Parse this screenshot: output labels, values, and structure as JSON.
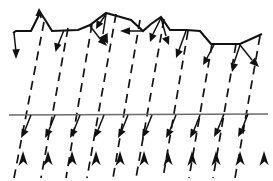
{
  "figure": {
    "width": 273,
    "height": 181,
    "background_color": "#ffffff"
  },
  "chart_data": {
    "type": "line",
    "title": "",
    "subtitle": "",
    "xlabel": "",
    "ylabel": "",
    "grid": false,
    "legend": "none",
    "xlim": [
      0,
      273
    ],
    "ylim": [
      181,
      0
    ],
    "series": [
      {
        "name": "terrain-surface-profile",
        "style": "solid-thick",
        "color": "#111111",
        "points": [
          [
            13,
            33
          ],
          [
            16,
            31
          ],
          [
            31,
            31
          ],
          [
            40,
            13
          ],
          [
            44,
            18
          ],
          [
            52,
            31
          ],
          [
            78,
            30
          ],
          [
            90,
            25
          ],
          [
            106,
            13
          ],
          [
            117,
            16
          ],
          [
            131,
            20
          ],
          [
            143,
            31
          ],
          [
            151,
            24
          ],
          [
            161,
            17
          ],
          [
            170,
            30
          ],
          [
            186,
            30
          ],
          [
            200,
            31
          ],
          [
            211,
            44
          ],
          [
            240,
            44
          ],
          [
            262,
            34
          ]
        ]
      },
      {
        "name": "reference-ground-line",
        "style": "solid-thin",
        "color": "#6b6b6b",
        "points": [
          [
            9,
            115
          ],
          [
            268,
            114
          ]
        ]
      }
    ],
    "rays": {
      "name": "incident-ray-family",
      "style": "dashed",
      "color": "#111111",
      "count": 10,
      "direction_deg": 100,
      "ground_crossings_x": [
        31,
        55,
        80,
        104,
        128,
        152,
        176,
        200,
        224,
        248
      ],
      "top_x": [
        44,
        68,
        92,
        116,
        140,
        164,
        188,
        212,
        236,
        260
      ],
      "bottom_x": [
        20,
        44,
        68,
        92,
        116,
        140,
        164,
        188,
        212,
        236
      ]
    },
    "annotations": {
      "surface_normals": {
        "count": 13,
        "description": "arrowheads pointing from surface inward"
      },
      "ground_normals": {
        "count": 10,
        "description": "arrowheads below reference line pointing down-left"
      },
      "bottom_arrows": {
        "count": 11,
        "description": "arrowheads at bottom pointing up along rays"
      }
    }
  },
  "elements": {
    "terrain_label": "terrain surface",
    "ground_label": "reference line",
    "ray_label": "incident rays"
  }
}
